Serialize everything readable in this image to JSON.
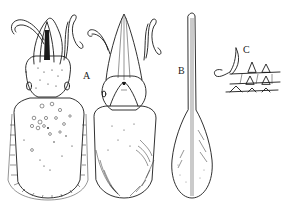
{
  "figure": {
    "labels": {
      "a": "A",
      "b": "B",
      "c": "C"
    },
    "panels": [
      {
        "id": "dorsal-view",
        "description": "cuttlefish dorsal view with spotted mantle and fringed fins"
      },
      {
        "id": "ventral-view",
        "description": "cuttlefish ventral view (A) with funnel and fins"
      },
      {
        "id": "cuttlebone",
        "description": "gladius / internal shell (B), long narrow rachis with paddle-shaped vane"
      },
      {
        "id": "suckers-detail",
        "description": "detail of sucker hooks (C)"
      }
    ],
    "colors": {
      "ink": "#1a1a1a",
      "background": "#ffffff"
    }
  }
}
